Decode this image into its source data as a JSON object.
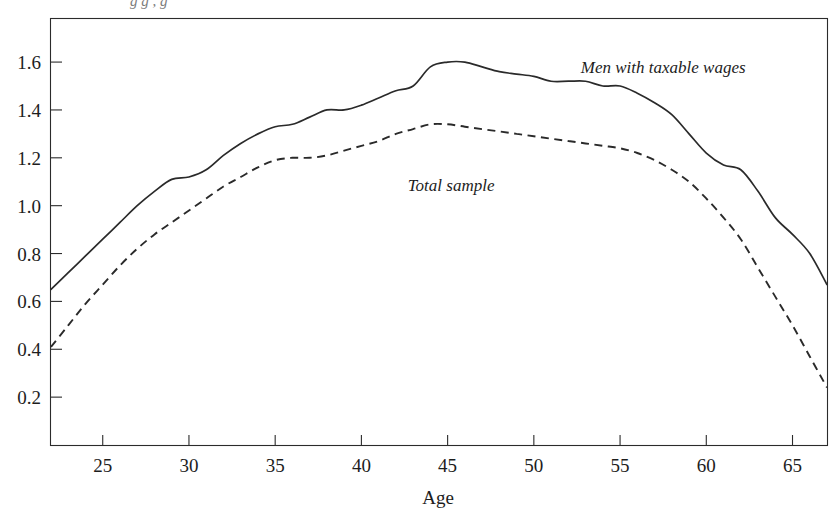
{
  "figure": {
    "clipped_title_fragment": "g g , g",
    "background_color": "#ffffff",
    "ink_color": "#2a2a2a"
  },
  "chart_data": {
    "type": "line",
    "title": "",
    "xlabel": "Age",
    "ylabel": "",
    "xlim": [
      22,
      67
    ],
    "ylim": [
      0,
      1.78
    ],
    "xticks": [
      25,
      30,
      35,
      40,
      45,
      50,
      55,
      60,
      65
    ],
    "yticks": [
      0.2,
      0.4,
      0.6,
      0.8,
      1.0,
      1.2,
      1.4,
      1.6
    ],
    "xtick_labels": [
      "25",
      "30",
      "35",
      "40",
      "45",
      "50",
      "55",
      "60",
      "65"
    ],
    "ytick_labels": [
      "0.2",
      "0.4",
      "0.6",
      "0.8",
      "1.0",
      "1.2",
      "1.4",
      "1.6"
    ],
    "grid": false,
    "legend_position": "inline-annotations",
    "frame": "full-box",
    "x": [
      22,
      23,
      24,
      25,
      26,
      27,
      28,
      29,
      30,
      31,
      32,
      33,
      34,
      35,
      36,
      37,
      38,
      39,
      40,
      41,
      42,
      43,
      44,
      45,
      46,
      47,
      48,
      49,
      50,
      51,
      52,
      53,
      54,
      55,
      56,
      57,
      58,
      59,
      60,
      61,
      62,
      63,
      64,
      65,
      66,
      67
    ],
    "series": [
      {
        "name": "Men with taxable wages",
        "style": "solid",
        "annotation": "Men with taxable wages",
        "annotation_x": 57.5,
        "annotation_y": 1.555,
        "values": [
          0.65,
          0.72,
          0.79,
          0.86,
          0.93,
          1.0,
          1.06,
          1.11,
          1.12,
          1.15,
          1.21,
          1.26,
          1.3,
          1.33,
          1.34,
          1.37,
          1.4,
          1.4,
          1.42,
          1.45,
          1.48,
          1.5,
          1.58,
          1.6,
          1.6,
          1.58,
          1.56,
          1.55,
          1.54,
          1.52,
          1.52,
          1.52,
          1.5,
          1.5,
          1.47,
          1.43,
          1.38,
          1.3,
          1.22,
          1.17,
          1.15,
          1.06,
          0.95,
          0.88,
          0.8,
          0.67
        ]
      },
      {
        "name": "Total sample",
        "style": "dashed",
        "annotation": "Total sample",
        "annotation_x": 45.2,
        "annotation_y": 1.06,
        "values": [
          0.41,
          0.5,
          0.59,
          0.67,
          0.75,
          0.82,
          0.88,
          0.93,
          0.98,
          1.03,
          1.08,
          1.12,
          1.16,
          1.19,
          1.2,
          1.2,
          1.21,
          1.23,
          1.25,
          1.27,
          1.3,
          1.32,
          1.34,
          1.34,
          1.33,
          1.32,
          1.31,
          1.3,
          1.29,
          1.28,
          1.27,
          1.26,
          1.25,
          1.24,
          1.22,
          1.19,
          1.15,
          1.1,
          1.03,
          0.95,
          0.86,
          0.74,
          0.62,
          0.5,
          0.37,
          0.24
        ]
      }
    ]
  }
}
